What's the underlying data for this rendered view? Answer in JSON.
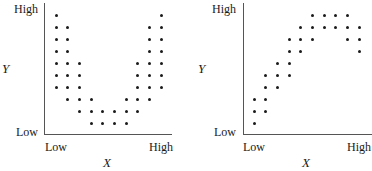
{
  "chart_data": [
    {
      "type": "scatter",
      "title": "",
      "xlabel": "X",
      "ylabel": "Y",
      "x_tick_labels": [
        "Low",
        "High"
      ],
      "y_tick_labels": [
        "Low",
        "High"
      ],
      "grid": false,
      "legend": null,
      "shape": "U-shaped (curvilinear) relationship",
      "xlim": [
        1,
        10
      ],
      "ylim": [
        0,
        10
      ],
      "columns": [
        {
          "x": 1,
          "y": [
            10,
            9,
            8,
            7,
            6,
            5,
            4
          ]
        },
        {
          "x": 2,
          "y": [
            9,
            8,
            7,
            6,
            5,
            4,
            3
          ]
        },
        {
          "x": 3,
          "y": [
            6,
            5,
            4,
            3,
            2
          ]
        },
        {
          "x": 4,
          "y": [
            3,
            2,
            1
          ]
        },
        {
          "x": 5,
          "y": [
            2,
            1
          ]
        },
        {
          "x": 6,
          "y": [
            2,
            1
          ]
        },
        {
          "x": 7,
          "y": [
            3,
            2,
            1
          ]
        },
        {
          "x": 8,
          "y": [
            6,
            5,
            4,
            3,
            2
          ]
        },
        {
          "x": 9,
          "y": [
            9,
            8,
            7,
            6,
            5,
            4,
            3
          ]
        },
        {
          "x": 10,
          "y": [
            10,
            9,
            8,
            7,
            6,
            5,
            4
          ]
        }
      ]
    },
    {
      "type": "scatter",
      "title": "",
      "xlabel": "X",
      "ylabel": "Y",
      "x_tick_labels": [
        "Low",
        "High"
      ],
      "y_tick_labels": [
        "Low",
        "High"
      ],
      "grid": false,
      "legend": null,
      "shape": "Curvilinear relationship rising then leveling/declining slightly",
      "xlim": [
        1,
        10
      ],
      "ylim": [
        0,
        10
      ],
      "columns": [
        {
          "x": 1,
          "y": [
            3,
            2,
            1
          ]
        },
        {
          "x": 2,
          "y": [
            5,
            4,
            3,
            2
          ]
        },
        {
          "x": 3,
          "y": [
            6,
            5,
            4
          ]
        },
        {
          "x": 4,
          "y": [
            8,
            7,
            6,
            5
          ]
        },
        {
          "x": 5,
          "y": [
            9,
            8,
            7
          ]
        },
        {
          "x": 6,
          "y": [
            10,
            9,
            8
          ]
        },
        {
          "x": 7,
          "y": [
            10,
            9
          ]
        },
        {
          "x": 8,
          "y": [
            10,
            9
          ]
        },
        {
          "x": 9,
          "y": [
            10,
            9,
            8
          ]
        },
        {
          "x": 10,
          "y": [
            9,
            8,
            7
          ]
        }
      ]
    }
  ],
  "labels": {
    "left": {
      "y_high": "High",
      "y_low": "Low",
      "x_low": "Low",
      "x_high": "High",
      "x_title": "X",
      "y_title": "Y"
    },
    "right": {
      "y_high": "High",
      "y_low": "Low",
      "x_low": "Low",
      "x_high": "High",
      "x_title": "X",
      "y_title": "Y"
    }
  }
}
